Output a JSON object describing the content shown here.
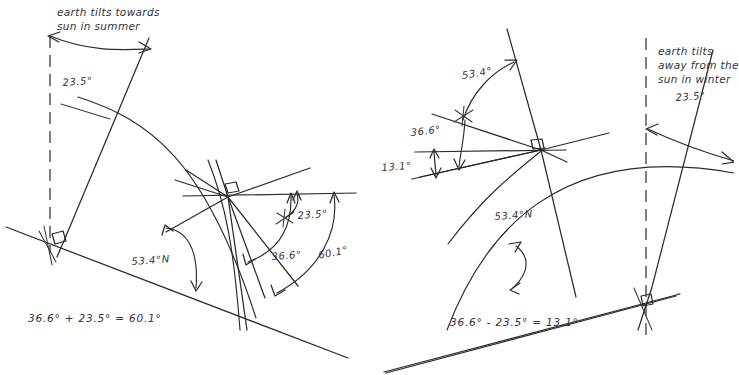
{
  "figure": {
    "title_visible": false,
    "background_color": "#ffffff",
    "ink_color": "#2b2b2b",
    "panels": [
      {
        "id": "summer",
        "side": "left",
        "note": "earth tilts towards\nsun in summer",
        "note_lines": [
          "earth tilts towards",
          "sun in summer"
        ],
        "equation": "36.6° + 23.5° = 60.1°",
        "angles": [
          {
            "name": "tilt-angle",
            "value": "23.5°"
          },
          {
            "name": "latitude-angle",
            "value": "53.4°N"
          },
          {
            "name": "solar-altitude-base",
            "value": "36.6°"
          },
          {
            "name": "solar-altitude-summer",
            "value": "60.1°"
          },
          {
            "name": "tilt-angle-at-observer",
            "value": "23.5°"
          }
        ]
      },
      {
        "id": "winter",
        "side": "right",
        "note": "earth tilts\naway from the\nsun in winter",
        "note_lines": [
          "earth tilts",
          "away from the",
          "sun in winter"
        ],
        "equation": "36.6° - 23.5° = 13.1°",
        "angles": [
          {
            "name": "tilt-angle",
            "value": "23.5°"
          },
          {
            "name": "zenith-offset-angle",
            "value": "53.4°"
          },
          {
            "name": "solar-altitude-base",
            "value": "36.6°"
          },
          {
            "name": "solar-altitude-winter",
            "value": "13.1°"
          },
          {
            "name": "latitude-angle",
            "value": "53.4°N"
          }
        ]
      }
    ]
  },
  "left": {
    "note_line1": "earth tilts towards",
    "note_line2": "sun in summer",
    "angle_tilt": "23.5°",
    "angle_latitude": "53.4°N",
    "angle_tilt_observer": "23.5°",
    "angle_base_altitude": "36.6°",
    "angle_summer_altitude": "60.1°",
    "equation": "36.6° + 23.5° = 60.1°"
  },
  "right": {
    "note_line1": "earth tilts",
    "note_line2": "away from the",
    "note_line3": "sun in winter",
    "angle_tilt": "23.5°",
    "angle_zenith_offset": "53.4°",
    "angle_base_altitude": "36.6°",
    "angle_winter_altitude": "13.1°",
    "angle_latitude": "53.4°N",
    "equation": "36.6° - 23.5° = 13.1°"
  }
}
